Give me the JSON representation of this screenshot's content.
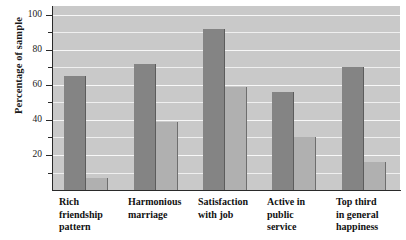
{
  "chart_data": {
    "type": "bar",
    "title": "",
    "xlabel": "",
    "ylabel": "Percentage of sample",
    "ylim": [
      0,
      105
    ],
    "yticks_major": [
      20,
      40,
      60,
      80,
      100
    ],
    "yticks_minor": [
      10,
      30,
      50,
      70,
      90
    ],
    "ytick_labels": [
      "20",
      "40",
      "60",
      "80",
      "100"
    ],
    "grid": true,
    "grid_orientation": "horizontal",
    "legend": "none",
    "categories": [
      "Rich\nfriendship\npattern",
      "Harmonious\nmarriage",
      "Satisfaction\nwith job",
      "Active in\npublic\nservice",
      "Top third\nin general\nhappiness"
    ],
    "series": [
      {
        "name": "dark-series",
        "color": "#848484",
        "values": [
          65,
          72,
          92,
          56,
          70
        ]
      },
      {
        "name": "light-series",
        "color": "#b0b0b0",
        "values": [
          7,
          39,
          59,
          30,
          16
        ]
      }
    ],
    "colors": {
      "plot_background": "#c9c9c9",
      "gridline": "#f2f2f2",
      "axis": "#2a2a2a",
      "dark_bar": "#848484",
      "light_bar": "#b0b0b0",
      "text": "#111111",
      "page_background": "#ffffff"
    }
  }
}
